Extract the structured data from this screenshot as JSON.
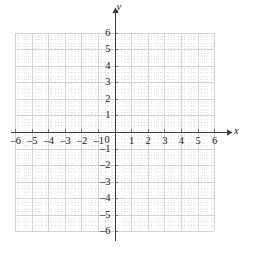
{
  "figure": {
    "kind": "cartesian-coordinate-plane",
    "width": 253,
    "height": 256,
    "background_color": "#ffffff"
  },
  "axes": {
    "x_axis_label": "x",
    "y_axis_label": "y",
    "origin_label": "0",
    "axis_color": "#3d3d3d",
    "minor_grid_color": "#d8d8d8",
    "major_grid_color": "#cfcfcf",
    "tick_color": "#6a6a6a",
    "label_color": "#1a1a1a"
  },
  "chart_data": {
    "type": "scatter",
    "title": "",
    "subtitle": "",
    "xlabel": "x",
    "ylabel": "y",
    "xlim": [
      -6,
      6
    ],
    "ylim": [
      -6,
      6
    ],
    "grid": true,
    "minor_grid": true,
    "minor_ticks_per_unit": 5,
    "legend": null,
    "legend_position": "none",
    "series": [],
    "annotations": [],
    "x_tick_values": [
      -6,
      -5,
      -4,
      -3,
      -2,
      -1,
      0,
      1,
      2,
      3,
      4,
      5,
      6
    ],
    "y_tick_values": [
      -6,
      -5,
      -4,
      -3,
      -2,
      -1,
      0,
      1,
      2,
      3,
      4,
      5,
      6
    ],
    "x_tick_labels": [
      "–6",
      "–5",
      "–4",
      "–3",
      "–2",
      "–1",
      "0",
      "1",
      "2",
      "3",
      "4",
      "5",
      "6"
    ],
    "y_tick_labels": [
      "–6",
      "–5",
      "–4",
      "–3",
      "–2",
      "–1",
      "0",
      "1",
      "2",
      "3",
      "4",
      "5",
      "6"
    ]
  },
  "x_labels": [
    {
      "text": "–6",
      "value": -6
    },
    {
      "text": "–5",
      "value": -5
    },
    {
      "text": "–4",
      "value": -4
    },
    {
      "text": "–3",
      "value": -3
    },
    {
      "text": "–2",
      "value": -2
    },
    {
      "text": "–1",
      "value": -1
    },
    {
      "text": "1",
      "value": 1
    },
    {
      "text": "2",
      "value": 2
    },
    {
      "text": "3",
      "value": 3
    },
    {
      "text": "4",
      "value": 4
    },
    {
      "text": "5",
      "value": 5
    },
    {
      "text": "6",
      "value": 6
    }
  ],
  "y_labels": [
    {
      "text": "6",
      "value": 6
    },
    {
      "text": "5",
      "value": 5
    },
    {
      "text": "4",
      "value": 4
    },
    {
      "text": "3",
      "value": 3
    },
    {
      "text": "2",
      "value": 2
    },
    {
      "text": "1",
      "value": 1
    },
    {
      "text": "–1",
      "value": -1
    },
    {
      "text": "–2",
      "value": -2
    },
    {
      "text": "–3",
      "value": -3
    },
    {
      "text": "–4",
      "value": -4
    },
    {
      "text": "–5",
      "value": -5
    },
    {
      "text": "–6",
      "value": -6
    }
  ]
}
